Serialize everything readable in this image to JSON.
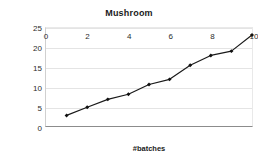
{
  "chart_data": {
    "type": "line",
    "title": "Mushroom",
    "xlabel": "#batches",
    "ylabel": "#patterns (in millions)",
    "x": [
      1,
      2,
      3,
      4,
      5,
      6,
      7,
      8,
      9,
      10
    ],
    "values": [
      2.7,
      4.8,
      6.8,
      8.1,
      10.6,
      11.9,
      15.5,
      18.0,
      19.1,
      23.2
    ],
    "series": [
      {
        "name": "Mushroom",
        "values": [
          2.7,
          4.8,
          6.8,
          8.1,
          10.6,
          11.9,
          15.5,
          18.0,
          19.1,
          23.2
        ]
      }
    ],
    "xlim": [
      0,
      10
    ],
    "ylim": [
      0,
      25
    ],
    "xticks": [
      0,
      2,
      4,
      6,
      8,
      10
    ],
    "yticks": [
      0,
      5,
      10,
      15,
      20,
      25
    ],
    "xtick_labels": [
      "0",
      "2",
      "4",
      "6",
      "8",
      "10"
    ],
    "ytick_labels": [
      "0",
      "5",
      "10",
      "15",
      "20",
      "25"
    ],
    "grid": true,
    "grid_axis": "y",
    "legend": false,
    "legend_position": "none",
    "line_color": "#1a1a1a",
    "marker": "diamond",
    "marker_color": "#111111",
    "background_color": "#ffffff",
    "gridline_color": "#e4e4e4",
    "axis_color": "#8c8c8c"
  }
}
